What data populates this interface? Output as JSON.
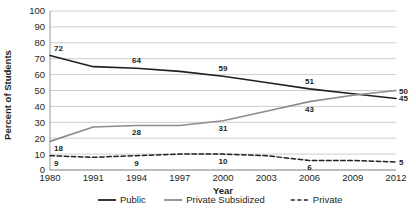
{
  "chart_data": {
    "type": "line",
    "title": "",
    "subtitle": "",
    "xlabel": "Year",
    "ylabel": "Percent of Students",
    "x": [
      1980,
      1991,
      1994,
      1997,
      2000,
      2003,
      2006,
      2009,
      2012
    ],
    "xtick_labels": [
      "1980",
      "1991",
      "1994",
      "1997",
      "2000",
      "2003",
      "2006",
      "2009",
      "2012"
    ],
    "ytick_labels": [
      "0",
      "10",
      "20",
      "30",
      "40",
      "50",
      "60",
      "70",
      "80",
      "90",
      "100"
    ],
    "ylim": [
      0,
      100
    ],
    "ystep": 10,
    "grid": "horizontal",
    "legend_position": "bottom",
    "series": [
      {
        "name": "Public",
        "color": "#231f20",
        "style": "solid",
        "values": [
          72,
          65,
          64,
          62,
          59,
          55,
          51,
          48,
          45
        ],
        "labels": [
          {
            "x": 1980,
            "value": 72,
            "text": "72"
          },
          {
            "x": 1994,
            "value": 64,
            "text": "64"
          },
          {
            "x": 2000,
            "value": 59,
            "text": "59"
          },
          {
            "x": 2006,
            "value": 51,
            "text": "51"
          },
          {
            "x": 2012,
            "value": 45,
            "text": "45"
          }
        ]
      },
      {
        "name": "Private Subsidized",
        "color": "#8c8c8c",
        "style": "solid",
        "values": [
          18,
          27,
          28,
          28,
          31,
          37,
          43,
          47,
          50
        ],
        "labels": [
          {
            "x": 1980,
            "value": 18,
            "text": "18"
          },
          {
            "x": 1994,
            "value": 28,
            "text": "28"
          },
          {
            "x": 2000,
            "value": 31,
            "text": "31"
          },
          {
            "x": 2006,
            "value": 43,
            "text": "43"
          },
          {
            "x": 2012,
            "value": 50,
            "text": "50"
          }
        ]
      },
      {
        "name": "Private",
        "color": "#231f20",
        "style": "dashed",
        "values": [
          9,
          8,
          9,
          10,
          10,
          9,
          6,
          6,
          5
        ],
        "labels": [
          {
            "x": 1980,
            "value": 9,
            "text": "9"
          },
          {
            "x": 1994,
            "value": 9,
            "text": "9"
          },
          {
            "x": 2000,
            "value": 10,
            "text": "10"
          },
          {
            "x": 2006,
            "value": 6,
            "text": "6"
          },
          {
            "x": 2012,
            "value": 5,
            "text": "5"
          }
        ]
      }
    ],
    "legend": [
      {
        "label": "Public",
        "color": "#231f20",
        "style": "solid"
      },
      {
        "label": "Private Subsidized",
        "color": "#8c8c8c",
        "style": "solid"
      },
      {
        "label": "Private",
        "color": "#231f20",
        "style": "dashed"
      }
    ]
  }
}
